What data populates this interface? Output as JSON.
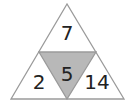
{
  "diagram": {
    "type": "number-triangle-puzzle",
    "numbers": {
      "top": "7",
      "center": "5",
      "bottom_left": "2",
      "bottom_right": "14"
    },
    "colors": {
      "outline": "#9a9a9a",
      "center_fill": "#b8b8b8",
      "outer_fill": "#ffffff",
      "text": "#222222"
    }
  }
}
